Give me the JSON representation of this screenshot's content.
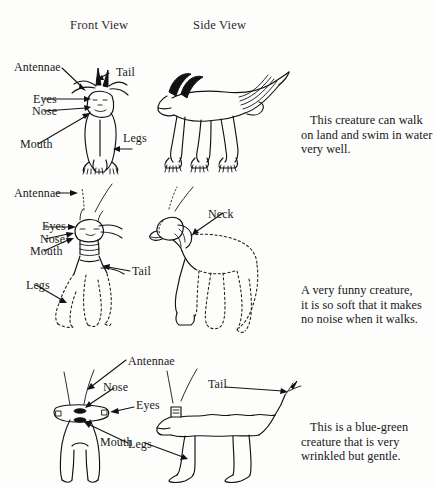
{
  "headers": {
    "front_view": "Front View",
    "side_view": "Side View"
  },
  "creatures": [
    {
      "id": "creature-1",
      "description": "This creature can walk on land and swim in water very well.",
      "description_lines": [
        "This creature can walk",
        "on land and swim in water",
        "very well."
      ],
      "front_labels": [
        {
          "name": "antennae",
          "text": "Antennae"
        },
        {
          "name": "tail",
          "text": "Tail"
        },
        {
          "name": "eyes",
          "text": "Eyes"
        },
        {
          "name": "nose",
          "text": "Nose"
        },
        {
          "name": "mouth",
          "text": "Mouth"
        },
        {
          "name": "legs",
          "text": "Legs"
        }
      ],
      "side_labels": []
    },
    {
      "id": "creature-2",
      "description": "A very funny creature, it is so soft that it makes no noise when it walks.",
      "description_lines": [
        "A very funny creature,",
        "it is so soft that it makes",
        "no noise when it walks."
      ],
      "front_labels": [
        {
          "name": "antennae",
          "text": "Antennae"
        },
        {
          "name": "eyes",
          "text": "Eyes"
        },
        {
          "name": "nose",
          "text": "Nose"
        },
        {
          "name": "mouth",
          "text": "Mouth"
        },
        {
          "name": "tail",
          "text": "Tail"
        },
        {
          "name": "legs",
          "text": "Legs"
        }
      ],
      "side_labels": [
        {
          "name": "neck",
          "text": "Neck"
        }
      ]
    },
    {
      "id": "creature-3",
      "description": "This is a blue-green creature that is very wrinkled but gentle.",
      "description_lines": [
        "This is a blue-green",
        "creature that is very",
        "wrinkled but gentle."
      ],
      "front_labels": [
        {
          "name": "antennae",
          "text": "Antennae"
        },
        {
          "name": "nose",
          "text": "Nose"
        },
        {
          "name": "eyes",
          "text": "Eyes"
        },
        {
          "name": "mouth",
          "text": "Mouth"
        }
      ],
      "side_labels": [
        {
          "name": "tail",
          "text": "Tail"
        },
        {
          "name": "legs",
          "text": "Legs"
        }
      ]
    }
  ],
  "colors": {
    "ink": "#111111",
    "paper": "#fdfdfc",
    "text": "#1a1a1a"
  }
}
